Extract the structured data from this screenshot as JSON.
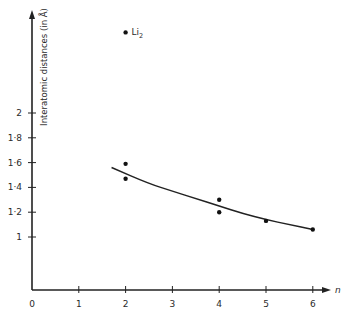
{
  "chart_data": {
    "type": "scatter",
    "title": "",
    "xlabel": "n",
    "ylabel": "Interatomic distances (in Å)",
    "xlim": [
      0,
      6.4
    ],
    "ylim": [
      0.58,
      2.9
    ],
    "grid": false,
    "legend": null,
    "x_ticks": [
      0,
      1,
      2,
      3,
      4,
      5,
      6
    ],
    "x_tick_labels": [
      "0",
      "1",
      "2",
      "3",
      "4",
      "5",
      "6"
    ],
    "y_ticks": [
      1,
      1.2,
      1.4,
      1.6,
      1.8,
      2
    ],
    "y_tick_labels": [
      "1",
      "1·2",
      "1·4",
      "1·6",
      "1·8",
      "2"
    ],
    "series": [
      {
        "name": "measured distances",
        "kind": "points",
        "points": [
          {
            "x": 2,
            "y": 2.65,
            "label": "Li2"
          },
          {
            "x": 2,
            "y": 1.59
          },
          {
            "x": 2,
            "y": 1.47
          },
          {
            "x": 4,
            "y": 1.3
          },
          {
            "x": 4,
            "y": 1.2
          },
          {
            "x": 5,
            "y": 1.13
          },
          {
            "x": 6,
            "y": 1.06
          }
        ]
      },
      {
        "name": "fitted trend",
        "kind": "curve",
        "points": [
          {
            "x": 1.7,
            "y": 1.56
          },
          {
            "x": 2.5,
            "y": 1.43
          },
          {
            "x": 3.0,
            "y": 1.37
          },
          {
            "x": 3.5,
            "y": 1.31
          },
          {
            "x": 4.0,
            "y": 1.25
          },
          {
            "x": 4.5,
            "y": 1.19
          },
          {
            "x": 5.0,
            "y": 1.14
          },
          {
            "x": 5.5,
            "y": 1.1
          },
          {
            "x": 6.0,
            "y": 1.06
          }
        ]
      }
    ],
    "annotations": [
      {
        "text": "Li",
        "subscript": "2",
        "x": 2,
        "y": 2.65
      }
    ]
  }
}
